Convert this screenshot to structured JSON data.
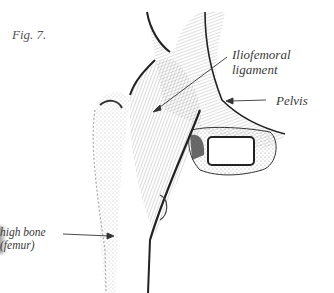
{
  "figure": {
    "title": "Fig. 7.",
    "labels": {
      "iliofemoral_line1": "Iliofemoral",
      "iliofemoral_line2": "ligament",
      "pelvis": "Pelvis",
      "thigh_line1": "high bone",
      "thigh_line2": "(femur)"
    },
    "colors": {
      "ink": "#2a2a2a",
      "background": "#ffffff",
      "label_text": "#3a3a3a"
    }
  }
}
